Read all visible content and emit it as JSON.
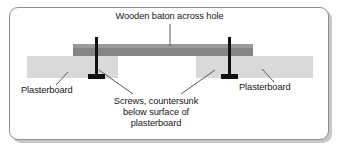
{
  "figure": {
    "title_label": "Wooden baton across hole",
    "left_label": "Plasterboard",
    "right_label": "Plasterboard",
    "screws_caption": "Screws, countersunk below surface of plasterboard",
    "screws_caption_line1": "Screws, countersunk",
    "screws_caption_line2": "below surface of",
    "screws_caption_line3": "plasterboard"
  },
  "colors": {
    "frame_border": "#8d8d8d",
    "frame_shadow": "#c8c8c8",
    "baton_fill": "#858585",
    "baton_top_highlight": "#9a9a9a",
    "plasterboard_fill": "#d9d9d9",
    "screw_fill": "#111111",
    "leader_line": "#55585c",
    "text": "#16181a",
    "background": "#ffffff"
  },
  "parts": {
    "baton": {
      "name": "wooden baton",
      "x": 73,
      "y": 44,
      "width": 180,
      "height": 12
    },
    "plasterboard_left": {
      "name": "plasterboard left panel",
      "x": 27,
      "y": 56,
      "width": 91,
      "height": 22
    },
    "plasterboard_right": {
      "name": "plasterboard right panel",
      "x": 196,
      "y": 56,
      "width": 117,
      "height": 22
    },
    "hole": {
      "name": "hole in plasterboard",
      "x": 118,
      "y": 56,
      "width": 78,
      "height": 22
    },
    "screw_left": {
      "name": "countersunk screw left",
      "shaft_x": 95,
      "shaft_y": 37,
      "shaft_width": 3,
      "shaft_height": 38,
      "head_x": 88,
      "head_y": 75,
      "head_width": 17,
      "head_height": 4
    },
    "screw_right": {
      "name": "countersunk screw right",
      "shaft_x": 228,
      "shaft_y": 37,
      "shaft_width": 3,
      "shaft_height": 38,
      "head_x": 221,
      "head_y": 75,
      "head_width": 17,
      "head_height": 4
    }
  },
  "leaders": {
    "title": {
      "x1": 170,
      "y1": 24,
      "x2": 170,
      "y2": 46
    },
    "left_plasterboard": {
      "x1": 57,
      "y1": 84,
      "x2": 68,
      "y2": 72
    },
    "right_plasterboard": {
      "x1": 273,
      "y1": 81,
      "x2": 262,
      "y2": 69
    },
    "screw_left_leader": {
      "x1": 132,
      "y1": 94,
      "x2": 99,
      "y2": 70
    },
    "screw_right_leader": {
      "x1": 182,
      "y1": 94,
      "x2": 214,
      "y2": 70
    }
  }
}
